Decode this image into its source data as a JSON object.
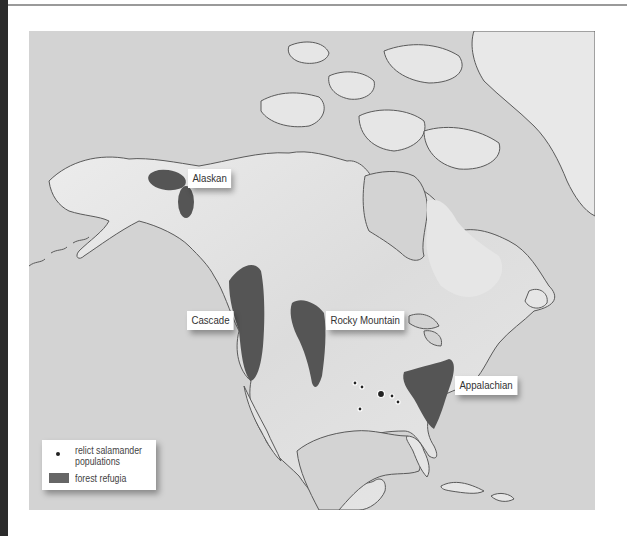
{
  "map": {
    "title": "North American forest refugia and relict salamander populations",
    "background_color": "#d3d3d3",
    "land_color": "#e4e4e4",
    "coast_color": "#555555",
    "refugia_color": "#555555",
    "refugia": [
      {
        "id": "alaskan",
        "label": "Alaskan"
      },
      {
        "id": "cascade",
        "label": "Cascade"
      },
      {
        "id": "rocky-mountain",
        "label": "Rocky Mountain"
      },
      {
        "id": "appalachian",
        "label": "Appalachian"
      }
    ],
    "salamander_dots_count": 6
  },
  "legend": {
    "items": [
      {
        "symbol": "dot",
        "label_line1": "relict salamander",
        "label_line2": "populations"
      },
      {
        "symbol": "swatch",
        "label": "forest refugia"
      }
    ]
  }
}
